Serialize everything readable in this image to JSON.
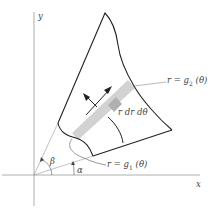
{
  "diagram": {
    "axes": {
      "x_label": "x",
      "y_label": "y"
    },
    "labels": {
      "outer_curve": {
        "lhs": "r = g",
        "sub": "2",
        "rhs": " (θ)"
      },
      "inner_curve": {
        "lhs": "r = g",
        "sub": "1",
        "rhs": " (θ)"
      },
      "area_element": "r dr dθ",
      "angle_alpha": "α",
      "angle_beta": "β"
    },
    "colors": {
      "stroke": "#222222",
      "axis": "#888888",
      "strip": "#c8c8c8",
      "strip_dark": "#a8a8a8",
      "label": "#444444"
    }
  }
}
